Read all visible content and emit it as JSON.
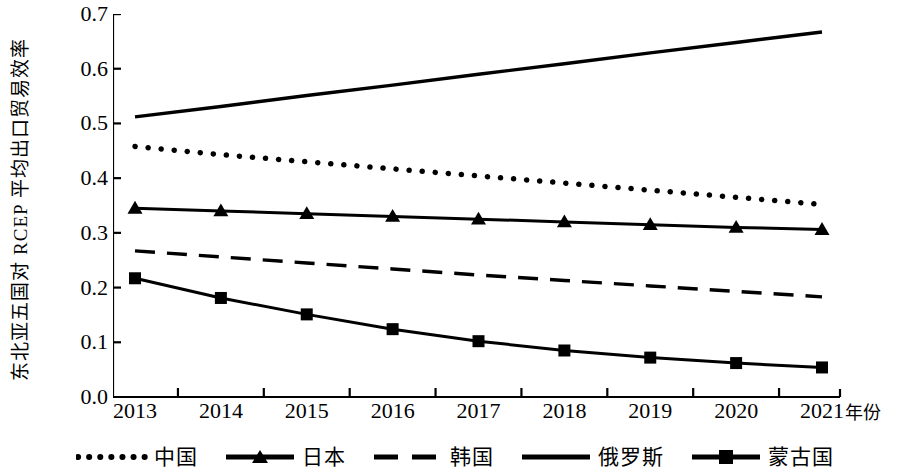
{
  "chart_data": {
    "type": "line",
    "title": "",
    "xlabel": "年份",
    "ylabel": "东北亚五国对 RCEP 平均出口贸易效率",
    "categories": [
      "2013",
      "2014",
      "2015",
      "2016",
      "2017",
      "2018",
      "2019",
      "2020",
      "2021"
    ],
    "xtick_labels": [
      "2013",
      "2014",
      "2015",
      "2016",
      "2017",
      "2018",
      "2019",
      "2020",
      "2021"
    ],
    "ytick_labels": [
      "0.7",
      "0.6",
      "0.5",
      "0.4",
      "0.3",
      "0.2",
      "0.1",
      "0.0"
    ],
    "ylim": [
      0.0,
      0.7
    ],
    "yticks": [
      0.0,
      0.1,
      0.2,
      0.3,
      0.4,
      0.5,
      0.6,
      0.7
    ],
    "grid": false,
    "legend_position": "bottom",
    "line_color": "#000000",
    "series": [
      {
        "name": "中国",
        "style": "dotted",
        "marker": "none",
        "values": [
          0.458,
          0.443,
          0.43,
          0.417,
          0.404,
          0.391,
          0.378,
          0.365,
          0.352
        ]
      },
      {
        "name": "日本",
        "style": "solid",
        "marker": "triangle",
        "values": [
          0.345,
          0.34,
          0.335,
          0.33,
          0.325,
          0.32,
          0.315,
          0.31,
          0.306
        ]
      },
      {
        "name": "韩国",
        "style": "dashed",
        "marker": "none",
        "values": [
          0.267,
          0.256,
          0.245,
          0.234,
          0.223,
          0.213,
          0.203,
          0.193,
          0.183
        ]
      },
      {
        "name": "俄罗斯",
        "style": "solid",
        "marker": "none",
        "values": [
          0.512,
          0.531,
          0.551,
          0.57,
          0.59,
          0.609,
          0.629,
          0.648,
          0.667
        ]
      },
      {
        "name": "蒙古国",
        "style": "solid",
        "marker": "square",
        "values": [
          0.217,
          0.181,
          0.151,
          0.124,
          0.102,
          0.085,
          0.072,
          0.062,
          0.054
        ]
      }
    ]
  },
  "legend": {
    "items": [
      {
        "label": "中国",
        "symbol": "dotted-line"
      },
      {
        "label": "日本",
        "symbol": "solid-line-triangle-marker"
      },
      {
        "label": "韩国",
        "symbol": "dashed-line"
      },
      {
        "label": "俄罗斯",
        "symbol": "solid-line"
      },
      {
        "label": "蒙古国",
        "symbol": "solid-line-square-marker"
      }
    ]
  },
  "axes": {
    "y_title": "东北亚五国对 RCEP 平均出口贸易效率",
    "x_title": "年份"
  }
}
